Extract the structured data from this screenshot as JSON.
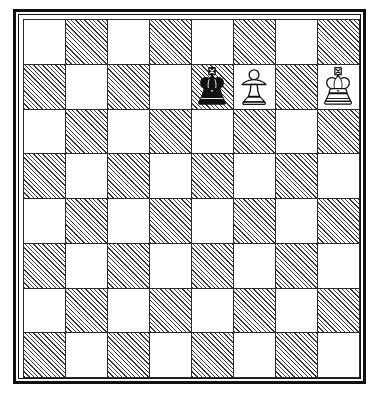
{
  "diagram": {
    "type": "chess-board-diagram",
    "orientation": "white-bottom",
    "board_size": 8,
    "files": [
      "a",
      "b",
      "c",
      "d",
      "e",
      "f",
      "g",
      "h"
    ],
    "ranks": [
      8,
      7,
      6,
      5,
      4,
      3,
      2,
      1
    ],
    "light_square_color": "#ffffff",
    "dark_square_fill": "hatched-diagonal",
    "dark_square_line_color": "#3a3a3a",
    "grid_line_color": "#2a2a2a",
    "frame_color": "#101010",
    "squares": [
      [
        "light",
        "dark",
        "light",
        "dark",
        "light",
        "dark",
        "light",
        "dark"
      ],
      [
        "dark",
        "light",
        "dark",
        "light",
        "dark",
        "light",
        "dark",
        "light"
      ],
      [
        "light",
        "dark",
        "light",
        "dark",
        "light",
        "dark",
        "light",
        "dark"
      ],
      [
        "dark",
        "light",
        "dark",
        "light",
        "dark",
        "light",
        "dark",
        "light"
      ],
      [
        "light",
        "dark",
        "light",
        "dark",
        "light",
        "dark",
        "light",
        "dark"
      ],
      [
        "dark",
        "light",
        "dark",
        "light",
        "dark",
        "light",
        "dark",
        "light"
      ],
      [
        "light",
        "dark",
        "light",
        "dark",
        "light",
        "dark",
        "light",
        "dark"
      ],
      [
        "dark",
        "light",
        "dark",
        "light",
        "dark",
        "light",
        "dark",
        "light"
      ]
    ],
    "pieces": [
      {
        "square": "e7",
        "file": "e",
        "rank": 7,
        "color": "black",
        "type": "king",
        "name": "black-king",
        "glyph": "♚"
      },
      {
        "square": "f7",
        "file": "f",
        "rank": 7,
        "color": "white",
        "type": "pawn",
        "name": "white-pawn",
        "glyph": "♙"
      },
      {
        "square": "h7",
        "file": "h",
        "rank": 7,
        "color": "white",
        "type": "king",
        "name": "white-king",
        "glyph": "♔"
      }
    ],
    "piece_placement": {
      "row_1_rank_8": [
        "",
        "",
        "",
        "",
        "",
        "",
        "",
        ""
      ],
      "row_2_rank_7": [
        "",
        "",
        "",
        "",
        "black-king",
        "white-pawn",
        "",
        "white-king"
      ],
      "row_3_rank_6": [
        "",
        "",
        "",
        "",
        "",
        "",
        "",
        ""
      ],
      "row_4_rank_5": [
        "",
        "",
        "",
        "",
        "",
        "",
        "",
        ""
      ],
      "row_5_rank_4": [
        "",
        "",
        "",
        "",
        "",
        "",
        "",
        ""
      ],
      "row_6_rank_3": [
        "",
        "",
        "",
        "",
        "",
        "",
        "",
        ""
      ],
      "row_7_rank_2": [
        "",
        "",
        "",
        "",
        "",
        "",
        "",
        ""
      ],
      "row_8_rank_1": [
        "",
        "",
        "",
        "",
        "",
        "",
        "",
        ""
      ]
    }
  }
}
